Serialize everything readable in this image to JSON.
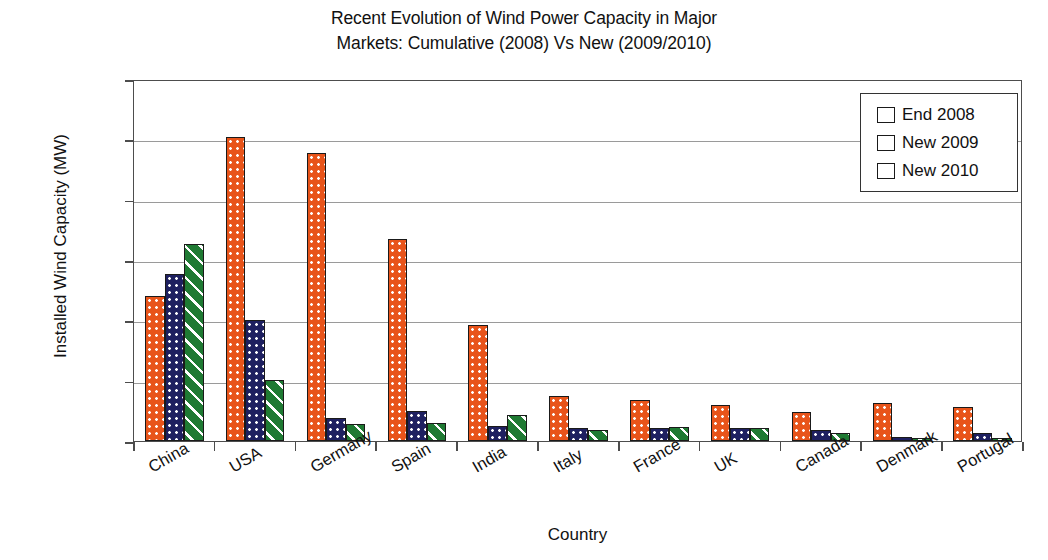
{
  "chart_data": {
    "type": "bar",
    "title": "Recent Evolution of Wind Power Capacity in Major Markets: Cumulative (2008) Vs New (2009/2010)",
    "title_lines": [
      "Recent Evolution of Wind Power Capacity in Major",
      "Markets: Cumulative (2008) Vs New (2009/2010)"
    ],
    "xlabel": "Country",
    "ylabel": "Installed Wind Capacity (MW)",
    "ylim": [
      0,
      30000
    ],
    "ytick_values": [
      0,
      5000,
      10000,
      15000,
      20000,
      25000,
      30000
    ],
    "ytick_labels": [
      "0",
      "5000",
      "10000",
      "15000",
      "20000",
      "25000",
      "30000"
    ],
    "grid": true,
    "legend_position": "top-right",
    "categories": [
      "China",
      "USA",
      "Germany",
      "Spain",
      "India",
      "Italy",
      "France",
      "UK",
      "Canada",
      "Denmark",
      "Portugal"
    ],
    "series": [
      {
        "name": "End 2008",
        "color": "#e8541a",
        "pattern": "dots",
        "values": [
          12020,
          25170,
          23900,
          16740,
          9600,
          3740,
          3400,
          2970,
          2370,
          3160,
          2860
        ]
      },
      {
        "name": "New 2009",
        "color": "#1e2060",
        "pattern": "dots",
        "values": [
          13800,
          9990,
          1920,
          2460,
          1270,
          1110,
          1090,
          1080,
          950,
          330,
          670
        ]
      },
      {
        "name": "New 2010",
        "color": "#1f7a33",
        "pattern": "diagonal-hatch",
        "values": [
          16320,
          5020,
          1400,
          1500,
          2140,
          950,
          1190,
          1120,
          690,
          220,
          210
        ]
      }
    ]
  },
  "legend": {
    "items": [
      {
        "label": "End 2008"
      },
      {
        "label": "New 2009"
      },
      {
        "label": "New 2010"
      }
    ]
  }
}
